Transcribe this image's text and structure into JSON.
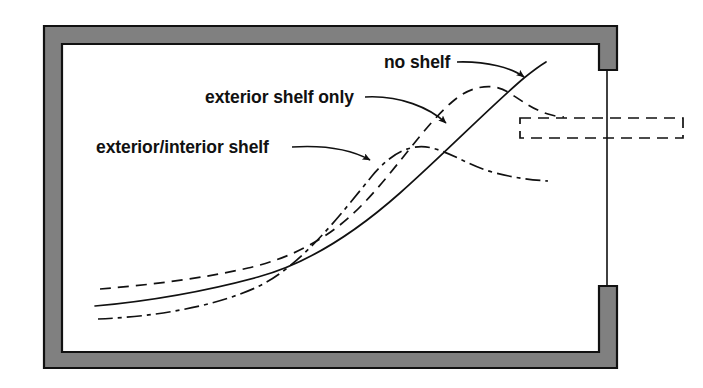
{
  "diagram": {
    "type": "architectural-section",
    "background_color": "#ffffff",
    "wall": {
      "name": "room-enclosure-wall",
      "fill_color": "#808080",
      "stroke_color": "#111111",
      "outer": {
        "x": 44,
        "y": 26,
        "width": 573,
        "height": 342
      },
      "inner": {
        "x": 62,
        "y": 44,
        "width": 537,
        "height": 308
      },
      "opening": {
        "name": "window-opening",
        "side": "right",
        "top_y": 70,
        "bottom_y": 286,
        "glazing_line_x": 607
      }
    },
    "shelf": {
      "name": "light-shelf",
      "style": "dashed-outline",
      "x": 520,
      "y": 118,
      "width": 163,
      "height": 20,
      "stroke_color": "#111111"
    },
    "labels": [
      {
        "id": "no-shelf",
        "text": "no shelf",
        "x": 384,
        "y": 68,
        "anchor": "start",
        "leader_arrow_target": [
          527,
          79
        ]
      },
      {
        "id": "exterior-shelf-only",
        "text": "exterior shelf only",
        "x": 205,
        "y": 103,
        "anchor": "start",
        "leader_arrow_target": [
          450,
          127
        ]
      },
      {
        "id": "exterior-interior-shelf",
        "text": "exterior/interior shelf",
        "x": 96,
        "y": 153,
        "anchor": "start",
        "leader_arrow_target": [
          375,
          163
        ]
      }
    ],
    "curves": [
      {
        "id": "no-shelf-curve",
        "name": "no shelf",
        "line_style": "solid",
        "stroke_color": "#111111",
        "stroke_width": 1.7,
        "description": "Smooth monotonic rise from low left to upper right, steepest near the window."
      },
      {
        "id": "exterior-shelf-only-curve",
        "name": "exterior shelf only",
        "line_style": "dashed",
        "stroke_color": "#111111",
        "stroke_width": 1.7,
        "description": "Rises from left, steep climb, rounded peak near the window head, then falls back toward the shelf."
      },
      {
        "id": "exterior-interior-shelf-curve",
        "name": "exterior/interior shelf",
        "line_style": "dash-dot",
        "stroke_color": "#111111",
        "stroke_width": 1.7,
        "description": "Starts lowest at left, rises to a broad early peak deeper in the room, then declines toward the window."
      }
    ]
  }
}
